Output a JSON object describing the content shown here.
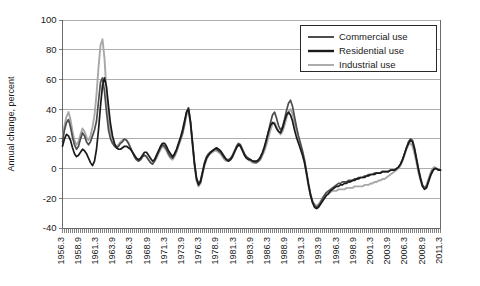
{
  "chart_data": {
    "type": "line",
    "title": "",
    "xlabel": "",
    "ylabel": "Annual change, percent",
    "ylim": [
      -40,
      100
    ],
    "yticks": [
      -40,
      -20,
      0,
      20,
      40,
      60,
      80,
      100
    ],
    "grid": true,
    "legend_position": "top-right",
    "legend_entries": [
      "Commercial use",
      "Residential use",
      "Industrial use"
    ],
    "xtick_labels": [
      "1956.3",
      "1958.9",
      "1961.3",
      "1963.9",
      "1966.3",
      "1968.9",
      "1971.3",
      "1973.9",
      "1976.3",
      "1978.9",
      "1981.3",
      "1983.9",
      "1986.3",
      "1988.9",
      "1991.3",
      "1993.9",
      "1996.3",
      "1998.9",
      "2001.3",
      "2003.9",
      "2006.3",
      "2008.9",
      "2011.3"
    ],
    "x_start": 1956.3,
    "x_end": 2011.6,
    "x_step": 0.25,
    "colors": {
      "commercial": "#4d4d4d",
      "residential": "#1a1a1a",
      "industrial": "#a8a8a8"
    },
    "series": [
      {
        "name": "Commercial use",
        "color": "#4d4d4d",
        "values": [
          18,
          26,
          31,
          33,
          28,
          21,
          16,
          13,
          15,
          20,
          24,
          22,
          18,
          16,
          18,
          22,
          26,
          32,
          45,
          58,
          61,
          52,
          38,
          26,
          20,
          17,
          15,
          14,
          15,
          17,
          18,
          20,
          19,
          17,
          14,
          11,
          8,
          6,
          5,
          6,
          8,
          9,
          8,
          6,
          4,
          3,
          5,
          8,
          11,
          14,
          16,
          15,
          13,
          10,
          8,
          7,
          9,
          12,
          16,
          20,
          24,
          30,
          38,
          41,
          32,
          18,
          4,
          -6,
          -10,
          -8,
          -2,
          4,
          8,
          10,
          11,
          12,
          13,
          13,
          12,
          11,
          9,
          7,
          6,
          6,
          7,
          9,
          12,
          15,
          17,
          16,
          13,
          10,
          8,
          7,
          6,
          5,
          4,
          4,
          5,
          7,
          10,
          14,
          19,
          25,
          31,
          36,
          38,
          34,
          29,
          26,
          28,
          33,
          39,
          44,
          46,
          42,
          35,
          28,
          22,
          17,
          12,
          6,
          -2,
          -10,
          -17,
          -22,
          -25,
          -26,
          -25,
          -23,
          -20,
          -18,
          -16,
          -15,
          -14,
          -13,
          -12,
          -11,
          -10,
          -10,
          -9,
          -9,
          -9,
          -8,
          -8,
          -8,
          -7,
          -7,
          -6,
          -6,
          -6,
          -5,
          -5,
          -4,
          -4,
          -4,
          -3,
          -3,
          -3,
          -3,
          -2,
          -2,
          -2,
          -2,
          -1,
          -1,
          -1,
          0,
          1,
          3,
          6,
          10,
          14,
          18,
          20,
          19,
          14,
          7,
          0,
          -6,
          -11,
          -13,
          -12,
          -8,
          -4,
          -1,
          0,
          0,
          -1,
          -1
        ]
      },
      {
        "name": "Residential use",
        "color": "#1a1a1a",
        "values": [
          15,
          20,
          23,
          22,
          19,
          14,
          10,
          8,
          9,
          11,
          13,
          12,
          10,
          7,
          4,
          2,
          5,
          13,
          26,
          42,
          56,
          61,
          55,
          42,
          30,
          22,
          17,
          14,
          13,
          13,
          14,
          15,
          15,
          14,
          13,
          11,
          9,
          7,
          6,
          7,
          9,
          11,
          11,
          9,
          7,
          5,
          6,
          9,
          12,
          15,
          17,
          17,
          15,
          12,
          10,
          8,
          10,
          13,
          17,
          21,
          26,
          32,
          38,
          40,
          31,
          17,
          3,
          -7,
          -11,
          -9,
          -3,
          3,
          7,
          9,
          11,
          12,
          13,
          14,
          13,
          12,
          10,
          8,
          6,
          5,
          6,
          8,
          11,
          14,
          16,
          15,
          12,
          9,
          7,
          6,
          6,
          5,
          5,
          5,
          6,
          8,
          11,
          15,
          20,
          25,
          29,
          31,
          30,
          27,
          25,
          24,
          27,
          32,
          36,
          38,
          36,
          32,
          26,
          21,
          17,
          13,
          9,
          4,
          -3,
          -11,
          -18,
          -23,
          -26,
          -27,
          -26,
          -24,
          -22,
          -20,
          -18,
          -17,
          -15,
          -14,
          -13,
          -12,
          -12,
          -11,
          -11,
          -10,
          -10,
          -9,
          -9,
          -8,
          -8,
          -7,
          -7,
          -6,
          -6,
          -6,
          -5,
          -5,
          -4,
          -4,
          -4,
          -3,
          -3,
          -3,
          -2,
          -2,
          -2,
          -2,
          -1,
          -1,
          -1,
          0,
          1,
          3,
          6,
          10,
          14,
          17,
          19,
          18,
          13,
          6,
          -1,
          -7,
          -12,
          -14,
          -13,
          -9,
          -5,
          -2,
          0,
          0,
          -1,
          -1
        ]
      },
      {
        "name": "Industrial use",
        "color": "#a8a8a8",
        "values": [
          20,
          29,
          35,
          38,
          33,
          25,
          19,
          16,
          18,
          23,
          27,
          25,
          21,
          19,
          22,
          28,
          36,
          50,
          68,
          83,
          87,
          74,
          52,
          34,
          24,
          19,
          16,
          15,
          16,
          18,
          19,
          20,
          19,
          17,
          14,
          11,
          8,
          6,
          5,
          6,
          8,
          9,
          8,
          6,
          4,
          3,
          5,
          7,
          10,
          13,
          15,
          14,
          12,
          9,
          7,
          6,
          8,
          11,
          15,
          19,
          23,
          29,
          36,
          39,
          30,
          16,
          2,
          -8,
          -12,
          -10,
          -4,
          2,
          6,
          9,
          10,
          11,
          12,
          12,
          11,
          10,
          8,
          6,
          5,
          5,
          6,
          8,
          11,
          14,
          16,
          15,
          12,
          9,
          7,
          6,
          5,
          4,
          4,
          4,
          5,
          6,
          9,
          12,
          16,
          21,
          26,
          30,
          31,
          28,
          25,
          23,
          25,
          29,
          34,
          38,
          40,
          37,
          31,
          25,
          20,
          15,
          10,
          4,
          -4,
          -12,
          -18,
          -22,
          -24,
          -25,
          -24,
          -22,
          -20,
          -18,
          -17,
          -16,
          -16,
          -15,
          -15,
          -15,
          -14,
          -14,
          -14,
          -14,
          -13,
          -13,
          -13,
          -13,
          -12,
          -12,
          -12,
          -12,
          -12,
          -11,
          -11,
          -11,
          -10,
          -10,
          -9,
          -9,
          -8,
          -8,
          -7,
          -7,
          -6,
          -5,
          -4,
          -3,
          -2,
          -1,
          0,
          2,
          5,
          9,
          13,
          16,
          17,
          15,
          10,
          4,
          -3,
          -8,
          -12,
          -13,
          -11,
          -7,
          -3,
          0,
          1,
          0,
          -1,
          -1
        ]
      }
    ]
  }
}
